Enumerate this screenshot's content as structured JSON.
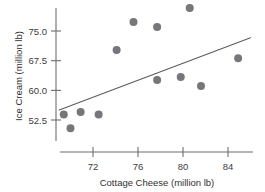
{
  "chart_data": {
    "type": "scatter",
    "title": "",
    "subtitle": "",
    "xlabel": "Cottage Cheese (million lb)",
    "ylabel": "Ice Cream (million lb)",
    "xlim": [
      68.6,
      86.4
    ],
    "ylim": [
      48.4,
      82.6
    ],
    "xticks": [
      72,
      76,
      80,
      84
    ],
    "xtick_labels": [
      "72",
      "76",
      "80",
      "84"
    ],
    "yticks": [
      52.5,
      60.0,
      67.5,
      75.0
    ],
    "ytick_labels": [
      "52.5",
      "60.0",
      "67.5",
      "75.0"
    ],
    "grid": false,
    "legend": null,
    "legend_position": "none",
    "marker": "circle",
    "marker_color": "#77777b",
    "marker_size": 4.0,
    "points": [
      {
        "x": 69.4,
        "y": 53.9
      },
      {
        "x": 70.0,
        "y": 50.4
      },
      {
        "x": 70.9,
        "y": 54.5
      },
      {
        "x": 72.5,
        "y": 53.9
      },
      {
        "x": 74.1,
        "y": 70.2
      },
      {
        "x": 75.6,
        "y": 77.3
      },
      {
        "x": 77.7,
        "y": 76.0
      },
      {
        "x": 77.7,
        "y": 62.6
      },
      {
        "x": 79.8,
        "y": 63.4
      },
      {
        "x": 80.6,
        "y": 80.8
      },
      {
        "x": 81.6,
        "y": 61.1
      },
      {
        "x": 84.9,
        "y": 68.1
      }
    ],
    "trend_line": {
      "type": "linear-fit",
      "color": "#5c5c60",
      "x_start": 69.0,
      "y_start": 55.0,
      "x_end": 86.0,
      "y_end": 73.3
    },
    "axis_color": "#6d6d6d",
    "text_color": "#3b3b3b",
    "background": "#ffffff"
  },
  "axes": {
    "y_axis_name": "ice-cream-axis",
    "x_axis_name": "cottage-cheese-axis"
  }
}
